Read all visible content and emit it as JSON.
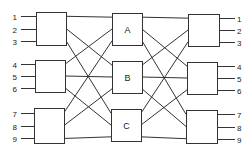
{
  "diagram": {
    "type": "three-stage switching network",
    "inputs": [
      "1",
      "2",
      "3",
      "4",
      "5",
      "6",
      "7",
      "8",
      "9"
    ],
    "outputs": [
      "1",
      "2",
      "3",
      "4",
      "5",
      "6",
      "7",
      "8",
      "9"
    ],
    "left_stage": [
      {
        "id": "L1",
        "label": "",
        "x": 36,
        "y": 12,
        "w": 30,
        "h": 33
      },
      {
        "id": "L2",
        "label": "",
        "x": 35,
        "y": 60,
        "w": 30,
        "h": 32
      },
      {
        "id": "L3",
        "label": "",
        "x": 34,
        "y": 108,
        "w": 30,
        "h": 35
      }
    ],
    "middle_stage": [
      {
        "id": "A",
        "label": "A",
        "x": 112,
        "y": 13,
        "w": 30,
        "h": 32
      },
      {
        "id": "B",
        "label": "B",
        "x": 112,
        "y": 61,
        "w": 30,
        "h": 32
      },
      {
        "id": "C",
        "label": "C",
        "x": 111,
        "y": 109,
        "w": 30,
        "h": 32
      }
    ],
    "right_stage": [
      {
        "id": "R1",
        "label": "",
        "x": 188,
        "y": 14,
        "w": 31,
        "h": 32
      },
      {
        "id": "R2",
        "label": "",
        "x": 187,
        "y": 62,
        "w": 30,
        "h": 32
      },
      {
        "id": "R3",
        "label": "",
        "x": 186,
        "y": 110,
        "w": 31,
        "h": 33
      }
    ],
    "colors": {
      "line": "#333333",
      "background": "#ffffff",
      "text": "#222222"
    }
  }
}
